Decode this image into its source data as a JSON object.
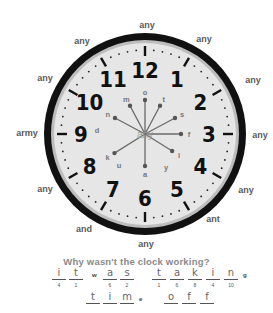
{
  "outer_labels": [
    {
      "text": "any",
      "x": 147,
      "y": 25
    },
    {
      "text": "any",
      "x": 204,
      "y": 39
    },
    {
      "text": "any",
      "x": 82,
      "y": 41
    },
    {
      "text": "any",
      "x": 253,
      "y": 80
    },
    {
      "text": "any",
      "x": 45,
      "y": 78
    },
    {
      "text": "army",
      "x": 27,
      "y": 133
    },
    {
      "text": "any",
      "x": 260,
      "y": 135
    },
    {
      "text": "any",
      "x": 45,
      "y": 189
    },
    {
      "text": "any",
      "x": 246,
      "y": 190
    },
    {
      "text": "ant",
      "x": 213,
      "y": 219
    },
    {
      "text": "and",
      "x": 84,
      "y": 229
    },
    {
      "text": "any",
      "x": 146,
      "y": 244
    }
  ],
  "clock": {
    "center_label": "any",
    "numerals": [
      "12",
      "1",
      "2",
      "3",
      "4",
      "5",
      "6",
      "7",
      "8",
      "9",
      "10",
      "11"
    ],
    "spokes": [
      {
        "letter": "o",
        "angle": 0,
        "len": 34
      },
      {
        "letter": "t",
        "angle": 28,
        "len": 32
      },
      {
        "letter": "s",
        "angle": 62,
        "len": 34
      },
      {
        "letter": "f",
        "angle": 90,
        "len": 36
      },
      {
        "letter": "i",
        "angle": 122,
        "len": 32
      },
      {
        "letter": "a",
        "angle": 180,
        "len": 32
      },
      {
        "letter": "k",
        "angle": 238,
        "len": 36
      },
      {
        "letter": "n",
        "angle": 298,
        "len": 34
      },
      {
        "letter": "m",
        "angle": 332,
        "len": 32
      }
    ],
    "loose_letters": [
      {
        "letter": "d",
        "x": 97,
        "y": 133
      },
      {
        "letter": "u",
        "x": 119,
        "y": 168
      },
      {
        "letter": "y",
        "x": 166,
        "y": 170
      }
    ]
  },
  "puzzle": {
    "question": "Why wasn't the clock working?",
    "line1": [
      {
        "type": "blank",
        "letter": "i",
        "num": "4",
        "x": 52
      },
      {
        "type": "blank",
        "letter": "t",
        "num": "1",
        "x": 69
      },
      {
        "type": "given",
        "letter": "w",
        "x": 92
      },
      {
        "type": "blank",
        "letter": "a",
        "num": "6",
        "x": 103
      },
      {
        "type": "blank",
        "letter": "s",
        "num": "2",
        "x": 120
      },
      {
        "type": "blank",
        "letter": "t",
        "num": "1",
        "x": 152
      },
      {
        "type": "blank",
        "letter": "a",
        "num": "6",
        "x": 170
      },
      {
        "type": "blank",
        "letter": "k",
        "num": "8",
        "x": 188
      },
      {
        "type": "blank",
        "letter": "i",
        "num": "4",
        "x": 206
      },
      {
        "type": "blank",
        "letter": "n",
        "num": "10",
        "x": 224
      },
      {
        "type": "given",
        "letter": "g",
        "x": 243
      }
    ],
    "line2": [
      {
        "type": "blank",
        "letter": "t",
        "num": "",
        "x": 86
      },
      {
        "type": "blank",
        "letter": "i",
        "num": "",
        "x": 103
      },
      {
        "type": "blank",
        "letter": "m",
        "num": "",
        "x": 120
      },
      {
        "type": "given",
        "letter": "e",
        "x": 139
      },
      {
        "type": "blank",
        "letter": "o",
        "num": "",
        "x": 164
      },
      {
        "type": "blank",
        "letter": "f",
        "num": "",
        "x": 182
      },
      {
        "type": "blank",
        "letter": "f",
        "num": "",
        "x": 200
      }
    ]
  }
}
